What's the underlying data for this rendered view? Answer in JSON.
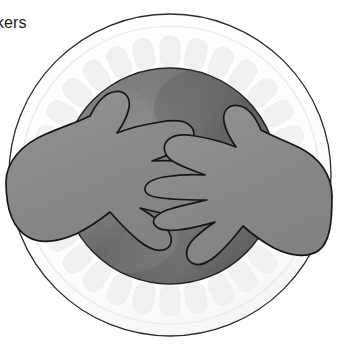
{
  "image": {
    "width": 338,
    "height": 347,
    "background_color": "#ffffff",
    "description": "Illustration of two hands with interlocking fingers resting on a round white scalloped plate with a dark gray center"
  },
  "caption": {
    "text": "kers",
    "note": "partial word cropped at left edge of frame",
    "color": "#1a1a1a"
  },
  "plate": {
    "name": "white-round-plate",
    "center_x": 170,
    "center_y": 175,
    "outer_radius": 162,
    "rim_color": "#ffffff",
    "rim_outline_color": "#2a2a2a",
    "inner_rim_radius": 150,
    "scallop": {
      "count": 30,
      "color": "#f3f3f3",
      "radius": 126,
      "tab_width": 20,
      "tab_height": 30
    },
    "shadow_color": "#b9b9b9"
  },
  "inner_disc": {
    "name": "dark-gray-center-disc",
    "center_x": 170,
    "center_y": 176,
    "radius": 108,
    "fill_top_color": "#6d6d6d",
    "fill_mid_color": "#7f7f7f",
    "fill_bottom_color": "#5f5f5f",
    "outline_color": "#1d1d1d"
  },
  "hands": {
    "fill_color": "#8a8a8a",
    "outline_color": "#161616",
    "outline_width": 1.6,
    "items": [
      {
        "name": "left-hand",
        "side": "left",
        "finger_count": 4,
        "thumb": true,
        "wrist_edge_x": 8
      },
      {
        "name": "right-hand",
        "side": "right",
        "finger_count": 4,
        "thumb": true,
        "wrist_edge_x": 330
      }
    ]
  },
  "colors": {
    "hand_gray": "#8a8a8a",
    "disc_gray": "#6f6f6f",
    "plate_white": "#ffffff",
    "scallop_gray": "#f2f2f2",
    "outline_black": "#1a1a1a",
    "shadow_gray": "#bdbdbd"
  }
}
